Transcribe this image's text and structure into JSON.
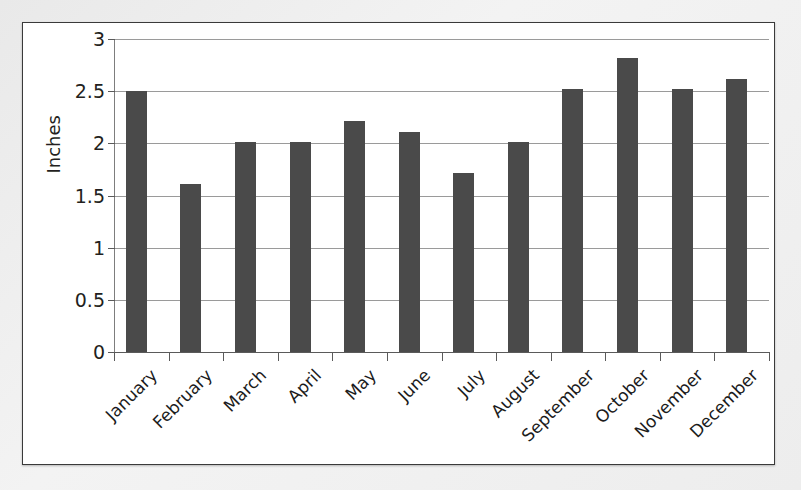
{
  "chart_data": {
    "type": "bar",
    "title": "",
    "subtitle": "",
    "xlabel": "",
    "ylabel": "Inches",
    "ylim": [
      0,
      3
    ],
    "y_ticks": [
      "0",
      "0.5",
      "1",
      "1.5",
      "2",
      "2.5",
      "3"
    ],
    "y_tick_values": [
      0,
      0.5,
      1,
      1.5,
      2,
      2.5,
      3
    ],
    "grid": true,
    "legend": false,
    "legend_position": "none",
    "bar_color": "#4a4a4a",
    "gridline_color": "#9a9a9a",
    "axis_color": "#5a5a5a",
    "plot_background": "#ffffff",
    "categories": [
      "January",
      "February",
      "March",
      "April",
      "May",
      "June",
      "July",
      "August",
      "September",
      "October",
      "November",
      "December"
    ],
    "values": [
      2.5,
      1.61,
      2.01,
      2.01,
      2.21,
      2.11,
      1.72,
      2.01,
      2.52,
      2.82,
      2.52,
      2.62
    ],
    "annotations": []
  },
  "figure": {
    "border_color": "#3a3a3a",
    "page_background": "#ededed"
  }
}
